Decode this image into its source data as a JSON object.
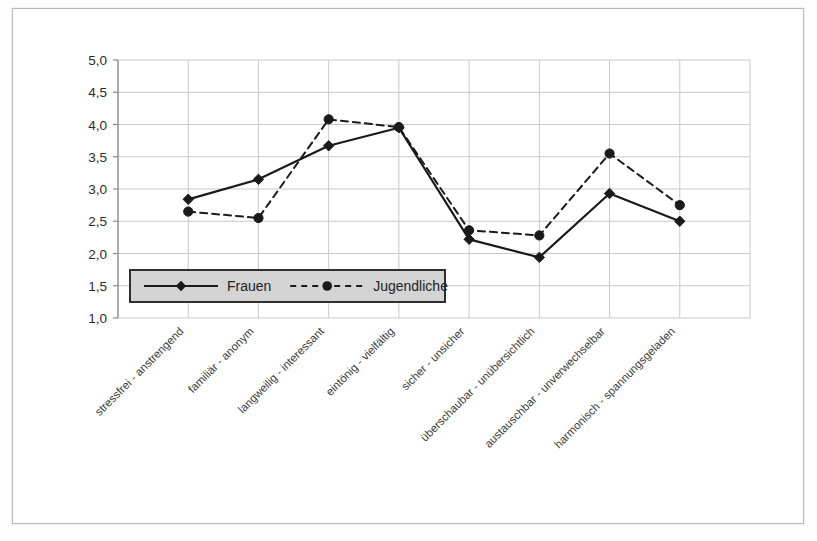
{
  "chart_data": {
    "type": "line",
    "title": "",
    "xlabel": "",
    "ylabel": "",
    "ylim": [
      1.0,
      5.0
    ],
    "y_tick_step": 0.5,
    "grid": true,
    "legend_position": "inside-bottom-left",
    "decimal_separator": ",",
    "categories": [
      "stressfrei - anstrengend",
      "familiär - anonym",
      "langweilig - interessant",
      "eintönig - vielfältig",
      "sicher - unsicher",
      "überschaubar - unübersichtlich",
      "austauschbar - unverwechselbar",
      "harmonisch - spannungsgeladen"
    ],
    "y_tick_labels": [
      "5,0",
      "4,5",
      "4,0",
      "3,5",
      "3,0",
      "2,5",
      "2,0",
      "1,5",
      "1,0"
    ],
    "y_tick_values": [
      5.0,
      4.5,
      4.0,
      3.5,
      3.0,
      2.5,
      2.0,
      1.5,
      1.0
    ],
    "series": [
      {
        "name": "Frauen",
        "marker": "diamond",
        "line_style": "solid",
        "color": "#1a1a1a",
        "values": [
          2.84,
          3.15,
          3.67,
          3.95,
          2.22,
          1.94,
          2.93,
          2.5
        ]
      },
      {
        "name": "Jugendliche",
        "marker": "circle",
        "line_style": "dashed",
        "color": "#1a1a1a",
        "values": [
          2.65,
          2.55,
          4.08,
          3.96,
          2.36,
          2.28,
          3.55,
          2.75
        ]
      }
    ]
  },
  "legend": {
    "entries": [
      {
        "label": "Frauen",
        "marker": "diamond",
        "line_style": "solid"
      },
      {
        "label": "Jugendliche",
        "marker": "circle",
        "line_style": "dashed"
      }
    ],
    "background_color": "#d4d4d4",
    "border_color": "#2f2f2f"
  },
  "colors": {
    "grid": "#c9c9c9",
    "axis": "#8a8a8a",
    "series": "#1a1a1a",
    "frame": "#b9b9b9",
    "page_background": "#ffffff"
  }
}
